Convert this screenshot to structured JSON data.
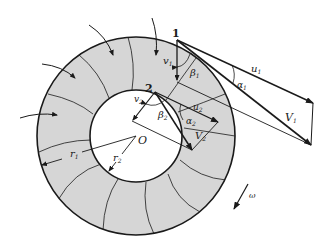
{
  "diagram": {
    "type": "centrifugal-turbine-velocity-diagram",
    "colors": {
      "ring_fill": "#d6d6d6",
      "line": "#1a1a1a",
      "background": "#ffffff"
    },
    "points": {
      "inlet": "1",
      "outlet": "2",
      "center": "O"
    },
    "labels": {
      "v1": "v",
      "v1_sub": "1",
      "u1": "u",
      "u1_sub": "1",
      "V1": "V",
      "V1_sub": "1",
      "alpha1": "α",
      "alpha1_sub": "1",
      "beta1": "β",
      "beta1_sub": "1",
      "v2": "v",
      "v2_sub": "2",
      "u2": "u",
      "u2_sub": "2",
      "V2": "V",
      "V2_sub": "2",
      "alpha2": "α",
      "alpha2_sub": "2",
      "beta2": "β",
      "beta2_sub": "2",
      "r1": "r",
      "r1_sub": "1",
      "r2": "r",
      "r2_sub": "2",
      "omega": "ω"
    }
  }
}
